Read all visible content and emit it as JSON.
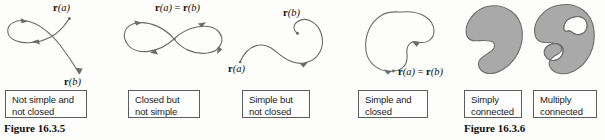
{
  "figure_left": {
    "number": "Figure 16.3.5",
    "panels": [
      {
        "id": "not-simple-not-closed",
        "caption": "Not simple and\nnot closed",
        "endpoint_labels": [
          {
            "prefix": "r",
            "arg": "(a)"
          },
          {
            "prefix": "r",
            "arg": "(b)"
          }
        ]
      },
      {
        "id": "closed-not-simple",
        "caption": "Closed but\nnot simple",
        "endpoint_labels": [
          {
            "prefix": "r",
            "arg": "(a)",
            "equals": " = ",
            "prefix2": "r",
            "arg2": "(b)"
          }
        ]
      },
      {
        "id": "simple-not-closed",
        "caption": "Simple but\nnot closed",
        "endpoint_labels": [
          {
            "prefix": "r",
            "arg": "(b)"
          },
          {
            "prefix": "r",
            "arg": "(a)"
          }
        ]
      },
      {
        "id": "simple-and-closed",
        "caption": "Simple and\nclosed",
        "endpoint_labels": [
          {
            "prefix": "r",
            "arg": "(a)",
            "equals": " = ",
            "prefix2": "r",
            "arg2": "(b)"
          }
        ]
      }
    ]
  },
  "figure_right": {
    "number": "Figure 16.3.6",
    "panels": [
      {
        "id": "simply-connected",
        "caption": "Simply\nconnected"
      },
      {
        "id": "multiply-connected",
        "caption": "Multiply\nconnected"
      }
    ]
  },
  "colors": {
    "background": "#fdfdfc",
    "curve_stroke": "#6b6b6b",
    "box_border": "#5d5d5d",
    "region_fill": "#a9a9a9",
    "region_stroke": "#6e6e6e",
    "hole_fill": "#ffffff",
    "text": "#1a1a1a"
  },
  "labels": {
    "ra": "r(a)",
    "rb": "r(b)",
    "ra_eq_rb": "r(a) = r(b)"
  }
}
